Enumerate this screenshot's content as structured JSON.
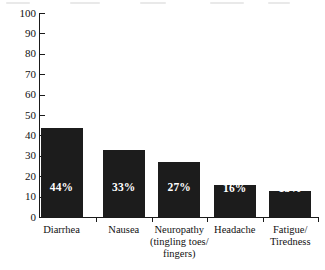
{
  "chart_data": {
    "type": "bar",
    "title": "",
    "xlabel": "",
    "ylabel": "",
    "ylim": [
      0,
      100
    ],
    "grid": false,
    "legend": "none",
    "categories": [
      "Diarrhea",
      "Neuropathy (tingling toes/fingers)",
      "Nausea",
      "Headache",
      "Fatigue/Tiredness"
    ],
    "category_lines": [
      [
        "Diarrhea"
      ],
      [
        "Nausea"
      ],
      [
        "Neuropathy",
        "(tingling toes/",
        "fingers)"
      ],
      [
        "Headache"
      ],
      [
        "Fatigue/",
        "Tiredness"
      ]
    ],
    "values": [
      44,
      33,
      27,
      16,
      13
    ],
    "data_labels": [
      "44%",
      "33%",
      "27%",
      "16%",
      "13%"
    ],
    "y_ticks": [
      0,
      10,
      20,
      30,
      40,
      50,
      60,
      70,
      80,
      90,
      100
    ],
    "y_tick_labels": [
      "0",
      "10",
      "20",
      "30",
      "40",
      "50",
      "60",
      "70",
      "80",
      "90",
      "100"
    ],
    "bar_color": "#1c1c1c",
    "data_label_color": "#ffffff",
    "axis_color": "#1a1a1a",
    "background_color": "#ffffff"
  }
}
